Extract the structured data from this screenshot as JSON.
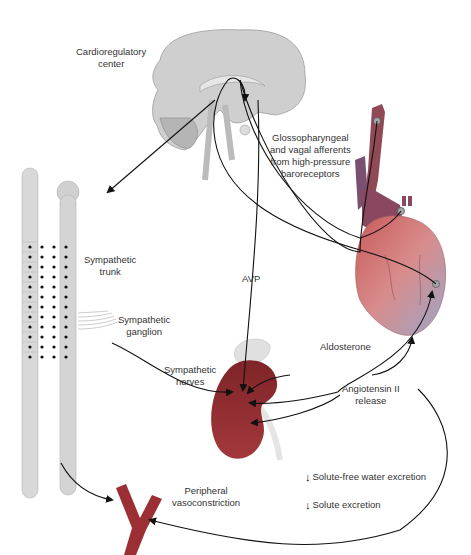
{
  "diagram": {
    "labels": {
      "cardioregulatory_center": "Cardioregulatory\ncenter",
      "cardio_line1": "Cardioregulatory",
      "cardio_line2": "center",
      "glosso_line1": "Glossopharyngeal",
      "glosso_line2": "and vagal afferents",
      "glosso_line3": "from high-pressure",
      "glosso_line4": "baroreceptors",
      "symp_trunk_line1": "Sympathetic",
      "symp_trunk_line2": "trunk",
      "symp_ganglion_line1": "Sympathetic",
      "symp_ganglion_line2": "ganglion",
      "avp": "AVP",
      "symp_nerves_line1": "Sympathetic",
      "symp_nerves_line2": "nerves",
      "aldosterone": "Aldosterone",
      "angiotensin_line1": "Angiotensin II",
      "angiotensin_line2": "release",
      "peripheral_line1": "Peripheral",
      "peripheral_line2": "vasoconstriction",
      "solute_free_water": "Solute-free water excretion",
      "solute_excretion": "Solute excretion"
    },
    "structures": [
      "brain",
      "spinal-cord",
      "sympathetic-chain",
      "heart",
      "aorta-carotid",
      "kidney",
      "adrenal-gland",
      "peripheral-vessel"
    ],
    "colors": {
      "brain": "#c9c9c9",
      "spinal": "#d4d4d4",
      "kidney": "#8a2a2e",
      "vessel": "#9c2f33",
      "heart_red": "#b03a3e",
      "heart_blue": "#6b7fa8",
      "arrow": "#111111"
    }
  }
}
